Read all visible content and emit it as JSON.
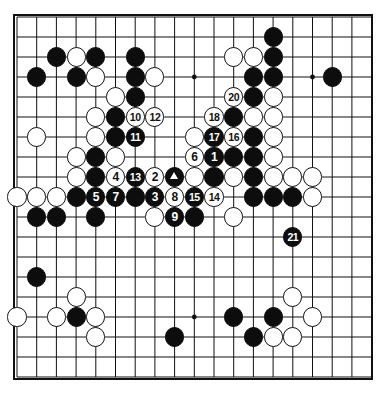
{
  "diagram": {
    "kind": "go-board-diagram",
    "board_size": 19,
    "colors": {
      "black": "#0d0d0d",
      "white": "#ffffff",
      "line": "#111111",
      "background": "#ffffff"
    },
    "geometry": {
      "origin_x": 17,
      "origin_y": 17,
      "step_x": 19.7,
      "step_y": 20.0,
      "stone_radius": 9.6
    },
    "star_points": [
      [
        3,
        3
      ],
      [
        9,
        3
      ],
      [
        15,
        3
      ],
      [
        3,
        9
      ],
      [
        9,
        9
      ],
      [
        15,
        9
      ],
      [
        3,
        15
      ],
      [
        9,
        15
      ],
      [
        15,
        15
      ]
    ]
  },
  "chart_data": {
    "type": "table",
    "stones": [
      {
        "c": 2,
        "r": 2,
        "color": "black",
        "label": ""
      },
      {
        "c": 3,
        "r": 2,
        "color": "white",
        "label": ""
      },
      {
        "c": 4,
        "r": 2,
        "color": "black",
        "label": ""
      },
      {
        "c": 6,
        "r": 2,
        "color": "black",
        "label": ""
      },
      {
        "c": 11,
        "r": 2,
        "color": "white",
        "label": ""
      },
      {
        "c": 12,
        "r": 2,
        "color": "white",
        "label": ""
      },
      {
        "c": 13,
        "r": 2,
        "color": "black",
        "label": ""
      },
      {
        "c": 13,
        "r": 1,
        "color": "black",
        "label": ""
      },
      {
        "c": 1,
        "r": 3,
        "color": "black",
        "label": ""
      },
      {
        "c": 3,
        "r": 3,
        "color": "black",
        "label": ""
      },
      {
        "c": 4,
        "r": 3,
        "color": "white",
        "label": ""
      },
      {
        "c": 6,
        "r": 3,
        "color": "black",
        "label": ""
      },
      {
        "c": 7,
        "r": 3,
        "color": "white",
        "label": ""
      },
      {
        "c": 12,
        "r": 3,
        "color": "black",
        "label": ""
      },
      {
        "c": 13,
        "r": 3,
        "color": "black",
        "label": ""
      },
      {
        "c": 16,
        "r": 3,
        "color": "black",
        "label": ""
      },
      {
        "c": 5,
        "r": 4,
        "color": "white",
        "label": ""
      },
      {
        "c": 6,
        "r": 4,
        "color": "black",
        "label": ""
      },
      {
        "c": 11,
        "r": 4,
        "color": "white",
        "label": "20"
      },
      {
        "c": 12,
        "r": 4,
        "color": "black",
        "label": ""
      },
      {
        "c": 13,
        "r": 4,
        "color": "white",
        "label": ""
      },
      {
        "c": 4,
        "r": 5,
        "color": "white",
        "label": ""
      },
      {
        "c": 5,
        "r": 5,
        "color": "black",
        "label": ""
      },
      {
        "c": 6,
        "r": 5,
        "color": "white",
        "label": "10"
      },
      {
        "c": 7,
        "r": 5,
        "color": "white",
        "label": "12"
      },
      {
        "c": 10,
        "r": 5,
        "color": "white",
        "label": "18"
      },
      {
        "c": 11,
        "r": 5,
        "color": "black",
        "label": ""
      },
      {
        "c": 12,
        "r": 5,
        "color": "white",
        "label": ""
      },
      {
        "c": 13,
        "r": 5,
        "color": "white",
        "label": ""
      },
      {
        "c": 1,
        "r": 6,
        "color": "white",
        "label": ""
      },
      {
        "c": 4,
        "r": 6,
        "color": "white",
        "label": ""
      },
      {
        "c": 5,
        "r": 6,
        "color": "black",
        "label": ""
      },
      {
        "c": 6,
        "r": 6,
        "color": "black",
        "label": "11"
      },
      {
        "c": 9,
        "r": 6,
        "color": "white",
        "label": ""
      },
      {
        "c": 10,
        "r": 6,
        "color": "black",
        "label": "17"
      },
      {
        "c": 11,
        "r": 6,
        "color": "white",
        "label": "16"
      },
      {
        "c": 12,
        "r": 6,
        "color": "black",
        "label": ""
      },
      {
        "c": 13,
        "r": 6,
        "color": "white",
        "label": ""
      },
      {
        "c": 3,
        "r": 7,
        "color": "white",
        "label": ""
      },
      {
        "c": 4,
        "r": 7,
        "color": "black",
        "label": ""
      },
      {
        "c": 5,
        "r": 7,
        "color": "white",
        "label": ""
      },
      {
        "c": 9,
        "r": 7,
        "color": "white",
        "label": "6"
      },
      {
        "c": 10,
        "r": 7,
        "color": "black",
        "label": "1"
      },
      {
        "c": 11,
        "r": 7,
        "color": "black",
        "label": ""
      },
      {
        "c": 12,
        "r": 7,
        "color": "black",
        "label": ""
      },
      {
        "c": 13,
        "r": 7,
        "color": "white",
        "label": ""
      },
      {
        "c": 3,
        "r": 8,
        "color": "white",
        "label": ""
      },
      {
        "c": 4,
        "r": 8,
        "color": "black",
        "label": ""
      },
      {
        "c": 5,
        "r": 8,
        "color": "white",
        "label": "4"
      },
      {
        "c": 6,
        "r": 8,
        "color": "black",
        "label": "13"
      },
      {
        "c": 7,
        "r": 8,
        "color": "white",
        "label": "2"
      },
      {
        "c": 8,
        "r": 8,
        "color": "black",
        "label": "triangle"
      },
      {
        "c": 9,
        "r": 8,
        "color": "white",
        "label": ""
      },
      {
        "c": 10,
        "r": 8,
        "color": "black",
        "label": ""
      },
      {
        "c": 11,
        "r": 8,
        "color": "white",
        "label": ""
      },
      {
        "c": 12,
        "r": 8,
        "color": "black",
        "label": ""
      },
      {
        "c": 13,
        "r": 8,
        "color": "white",
        "label": ""
      },
      {
        "c": 14,
        "r": 8,
        "color": "white",
        "label": ""
      },
      {
        "c": 15,
        "r": 8,
        "color": "white",
        "label": ""
      },
      {
        "c": 0,
        "r": 9,
        "color": "white",
        "label": ""
      },
      {
        "c": 1,
        "r": 9,
        "color": "white",
        "label": ""
      },
      {
        "c": 2,
        "r": 9,
        "color": "white",
        "label": ""
      },
      {
        "c": 3,
        "r": 9,
        "color": "black",
        "label": ""
      },
      {
        "c": 4,
        "r": 9,
        "color": "black",
        "label": "5"
      },
      {
        "c": 5,
        "r": 9,
        "color": "black",
        "label": "7"
      },
      {
        "c": 6,
        "r": 9,
        "color": "black",
        "label": ""
      },
      {
        "c": 7,
        "r": 9,
        "color": "black",
        "label": "3"
      },
      {
        "c": 8,
        "r": 9,
        "color": "white",
        "label": "8"
      },
      {
        "c": 9,
        "r": 9,
        "color": "black",
        "label": "15"
      },
      {
        "c": 10,
        "r": 9,
        "color": "white",
        "label": "14"
      },
      {
        "c": 12,
        "r": 9,
        "color": "black",
        "label": ""
      },
      {
        "c": 13,
        "r": 9,
        "color": "black",
        "label": ""
      },
      {
        "c": 14,
        "r": 9,
        "color": "black",
        "label": ""
      },
      {
        "c": 15,
        "r": 9,
        "color": "white",
        "label": ""
      },
      {
        "c": 1,
        "r": 10,
        "color": "black",
        "label": ""
      },
      {
        "c": 2,
        "r": 10,
        "color": "black",
        "label": ""
      },
      {
        "c": 4,
        "r": 10,
        "color": "black",
        "label": ""
      },
      {
        "c": 7,
        "r": 10,
        "color": "white",
        "label": ""
      },
      {
        "c": 8,
        "r": 10,
        "color": "black",
        "label": "9"
      },
      {
        "c": 9,
        "r": 10,
        "color": "black",
        "label": ""
      },
      {
        "c": 11,
        "r": 10,
        "color": "white",
        "label": ""
      },
      {
        "c": 14,
        "r": 11,
        "color": "black",
        "label": "21"
      },
      {
        "c": 1,
        "r": 13,
        "color": "black",
        "label": ""
      },
      {
        "c": 3,
        "r": 14,
        "color": "white",
        "label": ""
      },
      {
        "c": 14,
        "r": 14,
        "color": "white",
        "label": ""
      },
      {
        "c": 0,
        "r": 15,
        "color": "white",
        "label": ""
      },
      {
        "c": 2,
        "r": 15,
        "color": "white",
        "label": ""
      },
      {
        "c": 3,
        "r": 15,
        "color": "black",
        "label": ""
      },
      {
        "c": 4,
        "r": 15,
        "color": "white",
        "label": ""
      },
      {
        "c": 11,
        "r": 15,
        "color": "black",
        "label": ""
      },
      {
        "c": 13,
        "r": 15,
        "color": "black",
        "label": ""
      },
      {
        "c": 15,
        "r": 15,
        "color": "white",
        "label": ""
      },
      {
        "c": 4,
        "r": 16,
        "color": "white",
        "label": ""
      },
      {
        "c": 8,
        "r": 16,
        "color": "black",
        "label": ""
      },
      {
        "c": 12,
        "r": 16,
        "color": "black",
        "label": ""
      },
      {
        "c": 13,
        "r": 16,
        "color": "white",
        "label": ""
      },
      {
        "c": 14,
        "r": 16,
        "color": "white",
        "label": ""
      }
    ],
    "move_numbers": {
      "1": "black",
      "2": "white",
      "3": "black",
      "4": "white",
      "5": "black",
      "6": "white",
      "7": "black",
      "8": "white",
      "9": "black",
      "10": "white",
      "11": "black",
      "12": "white",
      "13": "black",
      "14": "white",
      "15": "black",
      "16": "white",
      "17": "black",
      "18": "white",
      "20": "white",
      "21": "black"
    },
    "marks": [
      {
        "c": 8,
        "r": 8,
        "mark": "triangle",
        "on": "black"
      }
    ]
  }
}
